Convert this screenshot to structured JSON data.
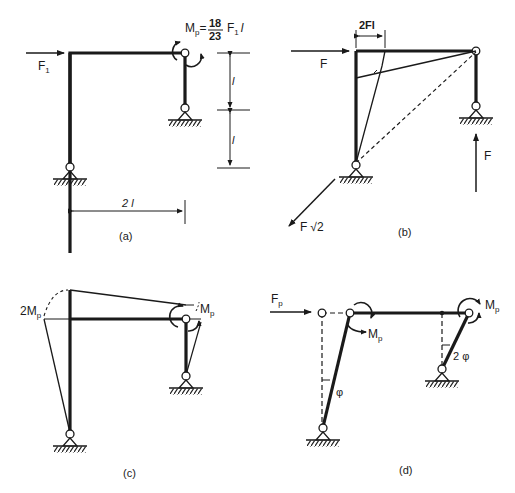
{
  "panels": {
    "a": {
      "caption": "(a)",
      "force_label": "F",
      "force_sub": "1",
      "mp_label": "M",
      "mp_sub": "p",
      "mp_eq": "=",
      "frac_num": "18",
      "frac_den": "23",
      "mp_tail": "F",
      "mp_tail_sub": "1",
      "mp_tail_l": "l",
      "dim_upper": "l",
      "dim_lower": "l",
      "dim_width": "2 l"
    },
    "b": {
      "caption": "(b)",
      "force_label": "F",
      "moment_dim": "2Fl",
      "reaction_right": "F",
      "reaction_left": "F",
      "reaction_left_root": "√2"
    },
    "c": {
      "caption": "(c)",
      "left_moment": "2M",
      "left_moment_sub": "p",
      "right_moment": "M",
      "right_moment_sub": "p"
    },
    "d": {
      "caption": "(d)",
      "force_label": "F",
      "force_sub": "p",
      "mid_moment": "M",
      "mid_moment_sub": "p",
      "right_moment": "M",
      "right_moment_sub": "p",
      "angle_left": "φ",
      "angle_right": "2 φ"
    }
  },
  "colors": {
    "ink": "#1a1a1a",
    "background": "#ffffff"
  }
}
